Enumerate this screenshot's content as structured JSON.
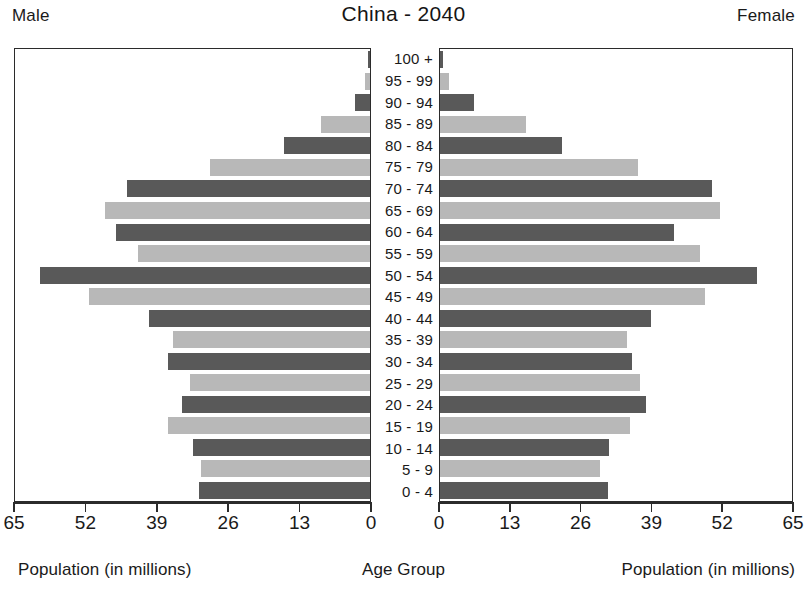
{
  "chart_title": "China - 2040",
  "labels": {
    "male_side": "Male",
    "female_side": "Female",
    "male_axis": "Population (in millions)",
    "center_axis": "Age Group",
    "female_axis": "Population (in millions)"
  },
  "axis": {
    "left_ticks": [
      "65",
      "52",
      "39",
      "26",
      "13",
      "0"
    ],
    "right_ticks": [
      "0",
      "13",
      "26",
      "39",
      "52",
      "65"
    ]
  },
  "chart_data": {
    "type": "bar",
    "subtype": "population-pyramid",
    "title": "China - 2040",
    "xlabel": "Population (in millions)",
    "ylabel": "Age Group",
    "xlim": [
      0,
      65
    ],
    "grid": false,
    "legend": "none",
    "tick_values": [
      0,
      13,
      26,
      39,
      52,
      65
    ],
    "categories": [
      "100 +",
      "95 - 99",
      "90 - 94",
      "85 - 89",
      "80 - 84",
      "75 - 79",
      "70 - 74",
      "65 - 69",
      "60 - 64",
      "55 - 59",
      "50 - 54",
      "45 - 49",
      "40 - 44",
      "35 - 39",
      "30 - 34",
      "25 - 29",
      "20 - 24",
      "15 - 19",
      "10 - 14",
      "5 - 9",
      "0 - 4"
    ],
    "series": [
      {
        "name": "Male",
        "side": "left",
        "color": "#595959",
        "alt_color": "#b8b8b8",
        "values": [
          0.4,
          1.0,
          2.7,
          9.0,
          15.8,
          29.3,
          44.5,
          48.5,
          46.5,
          42.5,
          60.5,
          51.5,
          40.5,
          36.0,
          37.0,
          33.0,
          34.5,
          37.0,
          32.5,
          31.0,
          31.3
        ]
      },
      {
        "name": "Female",
        "side": "right",
        "color": "#595959",
        "alt_color": "#b8b8b8",
        "values": [
          0.6,
          1.6,
          6.3,
          15.8,
          22.6,
          36.6,
          50.3,
          51.7,
          43.3,
          48.1,
          58.5,
          49.0,
          39.0,
          34.5,
          35.5,
          37.0,
          38.0,
          35.1,
          31.2,
          29.5,
          31.0
        ]
      }
    ]
  }
}
